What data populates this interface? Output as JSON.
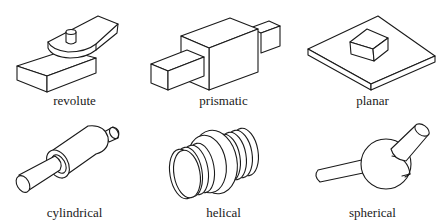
{
  "figure": {
    "joints": [
      {
        "id": "revolute",
        "label": "revolute",
        "icon": "revolute-joint-icon"
      },
      {
        "id": "prismatic",
        "label": "prismatic",
        "icon": "prismatic-joint-icon"
      },
      {
        "id": "planar",
        "label": "planar",
        "icon": "planar-joint-icon"
      },
      {
        "id": "cylindrical",
        "label": "cylindrical",
        "icon": "cylindrical-joint-icon"
      },
      {
        "id": "helical",
        "label": "helical",
        "icon": "helical-joint-icon"
      },
      {
        "id": "spherical",
        "label": "spherical",
        "icon": "spherical-joint-icon"
      }
    ],
    "colors": {
      "line": "#1a1a1a",
      "background": "#ffffff"
    }
  }
}
